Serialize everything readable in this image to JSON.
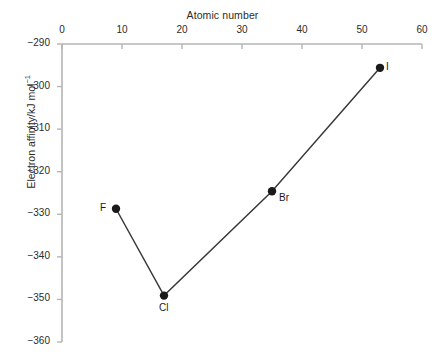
{
  "chart_data": {
    "type": "line",
    "title": "",
    "xlabel": "Atomic number",
    "ylabel": "Electron affinity/kJ mol",
    "ylabel_exponent": "−1",
    "xlim": [
      0,
      60
    ],
    "ylim": [
      -360,
      -290
    ],
    "xticks": [
      0,
      10,
      20,
      30,
      40,
      50,
      60
    ],
    "xtick_labels": [
      "0",
      "10",
      "20",
      "30",
      "40",
      "50",
      "60"
    ],
    "yticks": [
      -290,
      -300,
      -310,
      -320,
      -330,
      -340,
      -350,
      -360
    ],
    "ytick_labels": [
      "−290",
      "−300",
      "−310",
      "−320",
      "−330",
      "−340",
      "−350",
      "−360"
    ],
    "grid": false,
    "legend": "none",
    "x_axis_position": "top",
    "series": [
      {
        "name": "Halogen electron affinity",
        "x": [
          9,
          17,
          35,
          53
        ],
        "values": [
          -328.7,
          -349.1,
          -324.6,
          -295.6
        ],
        "point_labels": [
          "F",
          "Cl",
          "Br",
          "I"
        ],
        "label_positions": [
          "left",
          "below",
          "right",
          "right"
        ],
        "marker": "circle",
        "marker_color": "#1a1a1a",
        "line_color": "#3a3a3a"
      }
    ],
    "axis_color": "#b5b5b5",
    "text_color": "#2b2b2b",
    "background": "#ffffff"
  },
  "a11y": {
    "chart_role": "scatter-line chart of halogen electron affinity versus atomic number"
  }
}
